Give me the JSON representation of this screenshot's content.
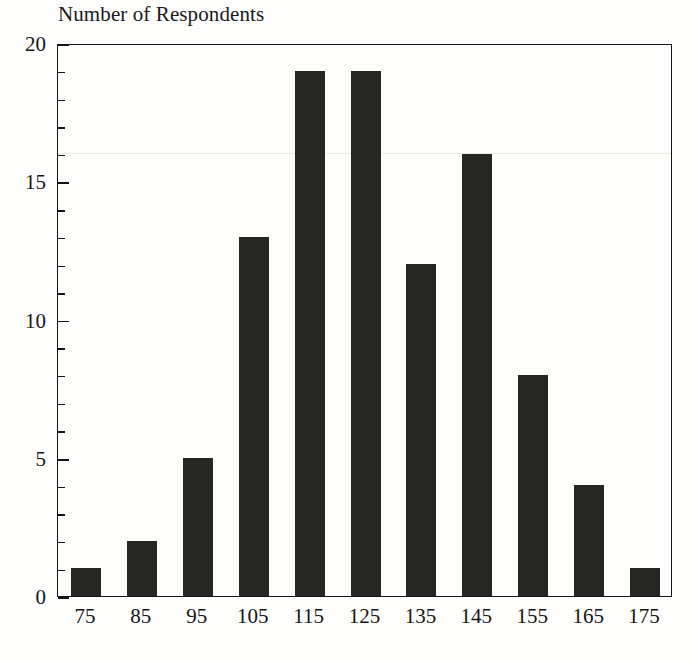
{
  "chart_data": {
    "type": "bar",
    "title": "Number of Respondents",
    "xlabel": "",
    "ylabel": "Number of Respondents",
    "categories": [
      "75",
      "85",
      "95",
      "105",
      "115",
      "125",
      "135",
      "145",
      "155",
      "165",
      "175"
    ],
    "values": [
      1,
      2,
      5,
      13,
      19,
      19,
      12,
      16,
      8,
      4,
      1
    ],
    "ylim": [
      0,
      20
    ],
    "y_major_ticks": [
      "0",
      "5",
      "10",
      "15",
      "20"
    ],
    "y_minor_tick_step": 1,
    "grid": false,
    "legend": "none",
    "bar_color": "#262625",
    "axis_color": "#141414",
    "background_color": "#fdfdfb"
  },
  "axes": {
    "y_tick_labels": [
      "0",
      "5",
      "10",
      "15",
      "20"
    ],
    "x_tick_labels": [
      "75",
      "85",
      "95",
      "105",
      "115",
      "125",
      "135",
      "145",
      "155",
      "165",
      "175"
    ]
  }
}
